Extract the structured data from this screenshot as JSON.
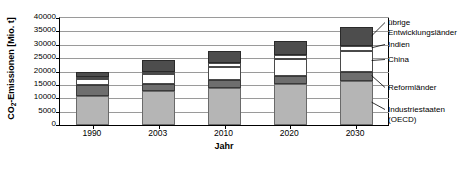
{
  "chart_data": {
    "type": "bar",
    "subtype": "stacked",
    "title": "",
    "xlabel": "Jahr",
    "ylabel": "CO2-Emissionen [Mio. t]",
    "ylabel_main": "CO",
    "ylabel_sub": "2",
    "ylabel_rest": "-Emissionen [Mio. t]",
    "categories": [
      "1990",
      "2003",
      "2010",
      "2020",
      "2030"
    ],
    "ylim": [
      0,
      40000
    ],
    "yticks": [
      0,
      5000,
      10000,
      15000,
      20000,
      25000,
      30000,
      35000,
      40000
    ],
    "ytick_labels": [
      "0",
      "5000",
      "10000",
      "15000",
      "20000",
      "25000",
      "30000",
      "35000",
      "40000"
    ],
    "grid": true,
    "legend_position": "right",
    "series": [
      {
        "name": "Industriestaaten (OECD)",
        "color": "#b5b5b5",
        "values": [
          11000,
          12600,
          13900,
          15200,
          16300
        ]
      },
      {
        "name": "Reformländer",
        "color": "#6e6e6e",
        "values": [
          4100,
          2600,
          2800,
          3200,
          3600
        ]
      },
      {
        "name": "China",
        "color": "#ffffff",
        "values": [
          2200,
          3800,
          5100,
          6400,
          7700
        ]
      },
      {
        "name": "Indien",
        "color": "#ffffff",
        "values": [
          600,
          900,
          1200,
          1500,
          1800
        ]
      },
      {
        "name": "übrige Entwicklungsländer",
        "color": "#4d4d4d",
        "values": [
          1900,
          4300,
          4500,
          5200,
          7100
        ]
      }
    ],
    "totals": [
      19800,
      24200,
      27500,
      31500,
      36500
    ],
    "legend_labels": [
      {
        "line1": "übrige",
        "line2": "Entwicklungsländer"
      },
      {
        "line1": "Indien",
        "line2": ""
      },
      {
        "line1": "China",
        "line2": ""
      },
      {
        "line1": "Reformländer",
        "line2": ""
      },
      {
        "line1": "Industriestaaten",
        "line2": "(OECD)"
      }
    ]
  }
}
